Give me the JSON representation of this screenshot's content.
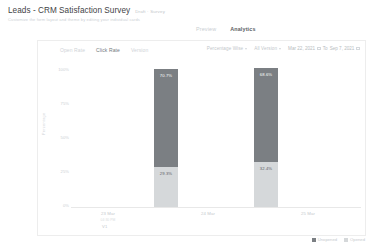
{
  "header": {
    "title": "Leads - CRM Satisfaction Survey",
    "meta": "Draft  ·  Survey",
    "subtitle": "Customize the form layout and theme by editing your individual cards"
  },
  "top_tabs": [
    {
      "label": "Preview",
      "active": false
    },
    {
      "label": "Analytics",
      "active": true
    }
  ],
  "sub_tabs": [
    {
      "label": "Open Rate",
      "active": false
    },
    {
      "label": "Click Rate",
      "active": true
    },
    {
      "label": "Version",
      "active": false
    }
  ],
  "filters": {
    "metric": "Percentage Wise",
    "version": "All Version",
    "date_from": "Mar 22, 2021",
    "date_to": "Sep 7, 2021",
    "date_separator": "To"
  },
  "legend_position": "bottom-right",
  "colors": {
    "unopened": "#7b7f83",
    "opened": "#d5d8da",
    "axis": "#e8e8e8",
    "text_muted": "#c6cace"
  },
  "chart_data": {
    "type": "bar",
    "title": "",
    "xlabel": "",
    "ylabel": "Percentage",
    "ylim": [
      0,
      100
    ],
    "ytick_labels": [
      "100%",
      "75%",
      "50%",
      "25%",
      "0%"
    ],
    "ytick_values": [
      100,
      75,
      50,
      25,
      0
    ],
    "grid": false,
    "stacked": true,
    "categories": [
      "23 Mar",
      "24 Mar",
      "25 Mar"
    ],
    "category_sublabels": [
      "04:30 PM",
      "",
      ""
    ],
    "version_label": "V1",
    "series": [
      {
        "name": "Unopened",
        "color": "#7b7f83",
        "values": [
          null,
          70.7,
          68.6
        ]
      },
      {
        "name": "Opened",
        "color": "#d5d8da",
        "values": [
          null,
          29.3,
          32.4
        ]
      }
    ],
    "bar_labels": [
      {
        "category": "24 Mar",
        "unopened": "70.7%",
        "opened": "29.3%"
      },
      {
        "category": "25 Mar",
        "unopened": "68.6%",
        "opened": "32.4%"
      }
    ],
    "legend": [
      "Unopened",
      "Opened"
    ]
  }
}
